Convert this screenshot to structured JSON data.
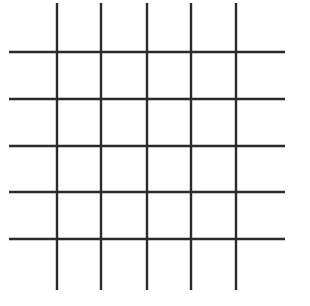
{
  "grid": {
    "line_color": "#2a2a2a",
    "line_width": 2.4,
    "vertical_lines_x": [
      57,
      101,
      147,
      191,
      236
    ],
    "vertical_extent": [
      3,
      290
    ],
    "horizontal_lines_y": [
      52,
      99,
      146,
      192,
      239
    ],
    "horizontal_extent": [
      9,
      285
    ],
    "rows": 5,
    "columns": 5
  }
}
